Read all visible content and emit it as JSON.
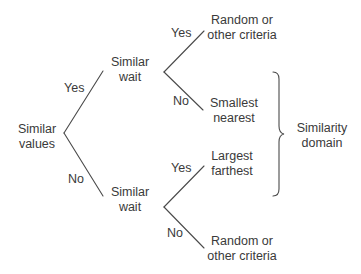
{
  "diagram": {
    "type": "decision-tree",
    "root": {
      "line1": "Similar",
      "line2": "values"
    },
    "level1": {
      "upper": {
        "line1": "Similar",
        "line2": "wait",
        "edge_label": "Yes"
      },
      "lower": {
        "line1": "Similar",
        "line2": "wait",
        "edge_label": "No"
      }
    },
    "leaves": {
      "upper_yes": {
        "line1": "Random or",
        "line2": "other criteria",
        "edge_label": "Yes"
      },
      "upper_no": {
        "line1": "Smallest",
        "line2": "nearest",
        "edge_label": "No"
      },
      "lower_yes": {
        "line1": "Largest",
        "line2": "farthest",
        "edge_label": "Yes"
      },
      "lower_no": {
        "line1": "Random or",
        "line2": "other criteria",
        "edge_label": "No"
      }
    },
    "brace_group": {
      "line1": "Similarity",
      "line2": "domain"
    },
    "colors": {
      "line": "#4a4a4a",
      "text": "#3a3a3a",
      "background": "#ffffff"
    }
  }
}
